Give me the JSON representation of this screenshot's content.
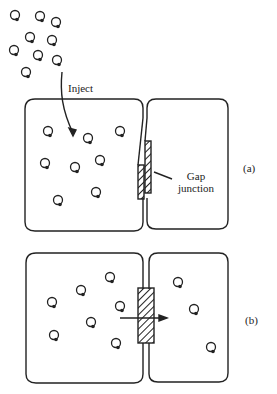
{
  "figure": {
    "inject_label": "Inject",
    "gap_junction_label_line1": "Gap",
    "gap_junction_label_line2": "junction",
    "panel_a_label": "(a)",
    "panel_b_label": "(b)"
  },
  "colors": {
    "ink": "#222222",
    "background": "#ffffff"
  },
  "molecules": {
    "free": [
      [
        15,
        15
      ],
      [
        40,
        16
      ],
      [
        56,
        22
      ],
      [
        30,
        37
      ],
      [
        52,
        40
      ],
      [
        14,
        50
      ],
      [
        38,
        55
      ],
      [
        57,
        60
      ],
      [
        26,
        72
      ]
    ],
    "panel_a_left": [
      [
        48,
        131
      ],
      [
        88,
        138
      ],
      [
        120,
        131
      ],
      [
        45,
        163
      ],
      [
        75,
        167
      ],
      [
        100,
        160
      ],
      [
        58,
        200
      ],
      [
        96,
        192
      ]
    ],
    "panel_b_left": [
      [
        52,
        302
      ],
      [
        81,
        290
      ],
      [
        110,
        277
      ],
      [
        120,
        306
      ],
      [
        91,
        322
      ],
      [
        54,
        335
      ],
      [
        116,
        343
      ]
    ],
    "panel_b_right": [
      [
        178,
        282
      ],
      [
        194,
        309
      ],
      [
        211,
        347
      ]
    ]
  }
}
